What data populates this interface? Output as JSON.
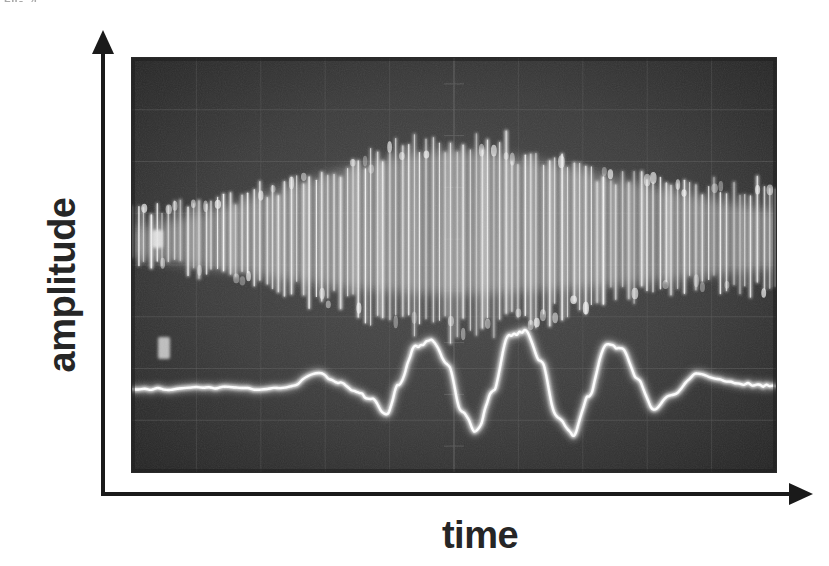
{
  "figure": {
    "top_fragment": "FIG. 4",
    "y_axis_label": "amplitude",
    "x_axis_label": "time",
    "photo_caption": "oscilloscope screen photograph",
    "background_color": "#ffffff",
    "ink_color": "#1a1a1a",
    "screen_color": "#3a3a3a",
    "trace_color": "#f2f2f2",
    "grid_color": "#5a5a5a"
  },
  "chart_data": {
    "type": "line",
    "title": "",
    "xlabel": "time",
    "ylabel": "amplitude",
    "grid": true,
    "legend": "none",
    "axis_style": "arrows, unlabeled ticks",
    "xlim": [
      0,
      10
    ],
    "ylim": [
      0,
      8
    ],
    "grid_divisions": {
      "horizontal": 8,
      "vertical": 10
    },
    "markers": [
      {
        "name": "channel-1-marker",
        "x_px": 155,
        "y_px": 238
      },
      {
        "name": "channel-2-marker",
        "x_px": 162,
        "y_px": 345
      }
    ],
    "series": [
      {
        "name": "upper-trace-modulated-carrier",
        "role": "high-frequency carrier with swelling envelope",
        "baseline_y": 4.55,
        "carrier_cycles": 105,
        "envelope_x": [
          0.0,
          0.5,
          1.0,
          1.5,
          2.0,
          2.5,
          3.0,
          3.5,
          4.0,
          4.5,
          5.0,
          5.5,
          6.0,
          6.5,
          7.0,
          7.5,
          8.0,
          8.5,
          9.0,
          9.5,
          10.0
        ],
        "envelope_amplitude": [
          0.55,
          0.62,
          0.7,
          0.8,
          0.95,
          1.12,
          1.32,
          1.55,
          1.75,
          1.92,
          2.0,
          1.95,
          1.82,
          1.62,
          1.42,
          1.26,
          1.15,
          1.08,
          1.05,
          1.08,
          1.12
        ]
      },
      {
        "name": "lower-trace-wave-packet",
        "role": "beat / wave packet, flat tails",
        "baseline_y": 1.62,
        "x": [
          0.0,
          0.6,
          1.2,
          1.8,
          2.4,
          2.9,
          3.2,
          3.45,
          3.7,
          3.95,
          4.15,
          4.4,
          4.65,
          4.9,
          5.12,
          5.35,
          5.6,
          5.85,
          6.1,
          6.35,
          6.6,
          6.85,
          7.1,
          7.35,
          7.6,
          7.85,
          8.1,
          8.4,
          8.8,
          9.3,
          9.7,
          10.0
        ],
        "values": [
          1.62,
          1.6,
          1.63,
          1.61,
          1.64,
          1.9,
          1.72,
          1.58,
          1.42,
          1.12,
          1.7,
          2.42,
          2.55,
          2.1,
          1.18,
          0.78,
          1.55,
          2.62,
          2.72,
          2.15,
          1.05,
          0.72,
          1.48,
          2.45,
          2.4,
          1.8,
          1.22,
          1.52,
          1.9,
          1.74,
          1.68,
          1.66
        ]
      }
    ]
  }
}
